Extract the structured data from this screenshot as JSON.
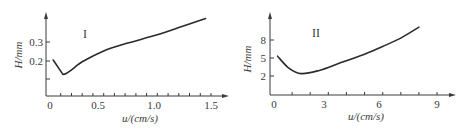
{
  "chart_data": [
    {
      "type": "line",
      "panel_label": "I",
      "title": "",
      "xlabel": "u/(cm/s)",
      "ylabel": "H/mm",
      "xlim": [
        0,
        1.6
      ],
      "ylim": [
        0,
        0.45
      ],
      "x_ticks": [
        0,
        0.5,
        1.0,
        1.5
      ],
      "x_tick_labels": [
        "0",
        "0.5",
        "1.0",
        "1.5"
      ],
      "x_minor_tick_step": 0.1,
      "y_ticks": [
        0.1,
        0.2,
        0.3
      ],
      "y_tick_labels": [
        "",
        "0.2",
        "0.3"
      ],
      "grid": false,
      "series": [
        {
          "name": "I",
          "x": [
            0.03,
            0.12,
            0.3,
            0.5,
            0.7,
            1.0,
            1.2,
            1.45
          ],
          "y": [
            0.2,
            0.12,
            0.19,
            0.25,
            0.29,
            0.34,
            0.38,
            0.43
          ]
        }
      ]
    },
    {
      "type": "line",
      "panel_label": "II",
      "title": "",
      "xlabel": "u/(cm/s)",
      "ylabel": "H/mm",
      "xlim": [
        0,
        10
      ],
      "ylim": [
        0,
        12
      ],
      "x_ticks": [
        0,
        3,
        6,
        9
      ],
      "x_tick_labels": [
        "0",
        "3",
        "6",
        "9"
      ],
      "x_minor_tick_step": 1,
      "y_ticks": [
        2,
        5,
        8
      ],
      "y_tick_labels": [
        "2",
        "5",
        "8"
      ],
      "grid": false,
      "series": [
        {
          "name": "II",
          "x": [
            0.2,
            0.8,
            1.5,
            2.5,
            3.7,
            5.0,
            6.0,
            7.0,
            8.0
          ],
          "y": [
            6.0,
            4.2,
            3.3,
            3.8,
            5.0,
            6.3,
            7.5,
            8.8,
            10.5
          ]
        }
      ]
    }
  ]
}
